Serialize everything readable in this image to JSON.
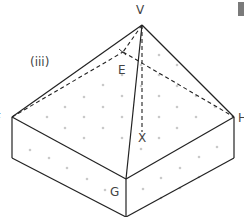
{
  "figure": {
    "part_label": "(iii)",
    "vertices": {
      "V": "V",
      "E": "E",
      "G": "G",
      "X": "X",
      "F": "F",
      "H": "H"
    }
  },
  "colors": {
    "line": "#222222",
    "dot": "#c8c8c8",
    "text": "#444444"
  }
}
